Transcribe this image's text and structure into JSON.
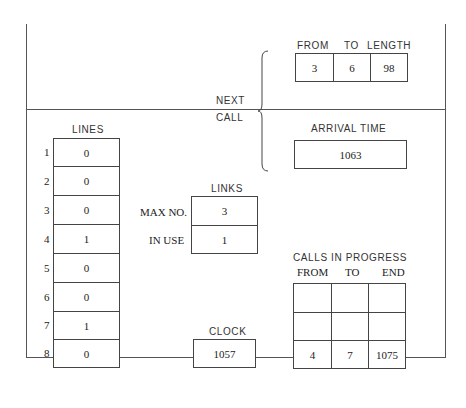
{
  "next_call": {
    "label_line1": "NEXT",
    "label_line2": "CALL",
    "columns": [
      "FROM",
      "TO",
      "LENGTH"
    ],
    "values": [
      "3",
      "6",
      "98"
    ],
    "arrival_time_label": "ARRIVAL TIME",
    "arrival_time": "1063"
  },
  "lines": {
    "title": "LINES",
    "rows": [
      {
        "num": "1",
        "value": "0"
      },
      {
        "num": "2",
        "value": "0"
      },
      {
        "num": "3",
        "value": "0"
      },
      {
        "num": "4",
        "value": "1"
      },
      {
        "num": "5",
        "value": "0"
      },
      {
        "num": "6",
        "value": "0"
      },
      {
        "num": "7",
        "value": "1"
      },
      {
        "num": "8",
        "value": "0"
      }
    ]
  },
  "links": {
    "title": "LINKS",
    "max_no_label": "MAX NO.",
    "max_no": "3",
    "in_use_label": "IN USE",
    "in_use": "1"
  },
  "clock": {
    "title": "CLOCK",
    "value": "1057"
  },
  "calls_in_progress": {
    "title": "CALLS IN PROGRESS",
    "columns": [
      "FROM",
      "TO",
      "END"
    ],
    "rows": [
      [
        "",
        "",
        ""
      ],
      [
        "",
        "",
        ""
      ],
      [
        "4",
        "7",
        "1075"
      ]
    ]
  }
}
